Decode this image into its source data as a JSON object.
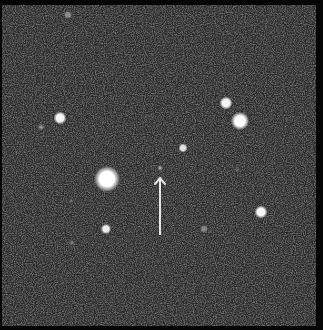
{
  "image": {
    "description": "Astronomical star field with arrow marking a faint object",
    "width": 323,
    "height": 330,
    "background_color": "#2a2a2a",
    "border_color": "#050505",
    "field_bounds": {
      "x": 2,
      "y": 5,
      "width": 314,
      "height": 321
    }
  },
  "stars": [
    {
      "name": "bright-star-center-left",
      "x": 107,
      "y": 179,
      "r": 10,
      "brightness": 1.0
    },
    {
      "name": "star-upper-left",
      "x": 60,
      "y": 118,
      "r": 5,
      "brightness": 0.95
    },
    {
      "name": "star-upper-right-a",
      "x": 226,
      "y": 103,
      "r": 5,
      "brightness": 0.95
    },
    {
      "name": "star-upper-right-b",
      "x": 240,
      "y": 121,
      "r": 7,
      "brightness": 1.0
    },
    {
      "name": "star-center",
      "x": 183,
      "y": 148,
      "r": 3.5,
      "brightness": 0.85
    },
    {
      "name": "star-right-lower",
      "x": 261,
      "y": 212,
      "r": 5,
      "brightness": 0.95
    },
    {
      "name": "star-lower-left",
      "x": 106,
      "y": 229,
      "r": 4,
      "brightness": 0.9
    },
    {
      "name": "faint-star-left",
      "x": 41,
      "y": 127,
      "r": 2.5,
      "brightness": 0.6
    },
    {
      "name": "faint-star-lower",
      "x": 204,
      "y": 229,
      "r": 3,
      "brightness": 0.35
    },
    {
      "name": "faint-star-bottom-left",
      "x": 72,
      "y": 243,
      "r": 2,
      "brightness": 0.4
    },
    {
      "name": "faint-star-top",
      "x": 68,
      "y": 15,
      "r": 3,
      "brightness": 0.4
    },
    {
      "name": "faint-star-right",
      "x": 237,
      "y": 170,
      "r": 2,
      "brightness": 0.3
    },
    {
      "name": "faint-dot-left",
      "x": 71,
      "y": 201,
      "r": 1.2,
      "brightness": 0.55
    }
  ],
  "target": {
    "name": "target-object",
    "x": 160,
    "y": 168,
    "r": 2,
    "brightness": 0.75
  },
  "arrow": {
    "x": 160,
    "y_start": 235,
    "y_end": 178,
    "color": "#e6e6e6",
    "stroke_width": 2
  }
}
